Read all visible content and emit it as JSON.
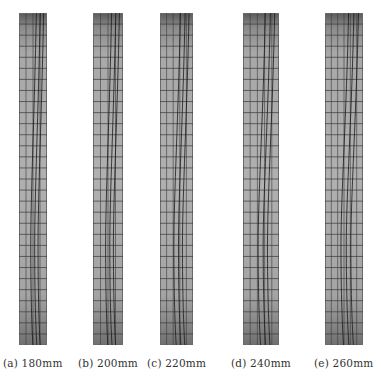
{
  "figure": {
    "panels": [
      {
        "id": "a",
        "label": "(a) 180mm",
        "thickness_mm": 180,
        "x": 19,
        "width": 28,
        "vlines": 4,
        "hlines": 30
      },
      {
        "id": "b",
        "label": "(b) 200mm",
        "thickness_mm": 200,
        "x": 93,
        "width": 30,
        "vlines": 4,
        "hlines": 30
      },
      {
        "id": "c",
        "label": "(c) 220mm",
        "thickness_mm": 220,
        "x": 160,
        "width": 33,
        "vlines": 5,
        "hlines": 30
      },
      {
        "id": "d",
        "label": "(d) 240mm",
        "thickness_mm": 240,
        "x": 243,
        "width": 36,
        "vlines": 5,
        "hlines": 30
      },
      {
        "id": "e",
        "label": "(e) 260mm",
        "thickness_mm": 260,
        "x": 325,
        "width": 38,
        "vlines": 6,
        "hlines": 30
      }
    ],
    "colors": {
      "fill": "#a8a8a8",
      "mesh": "#3a3a3a",
      "curve": "#1a1a1a"
    }
  }
}
